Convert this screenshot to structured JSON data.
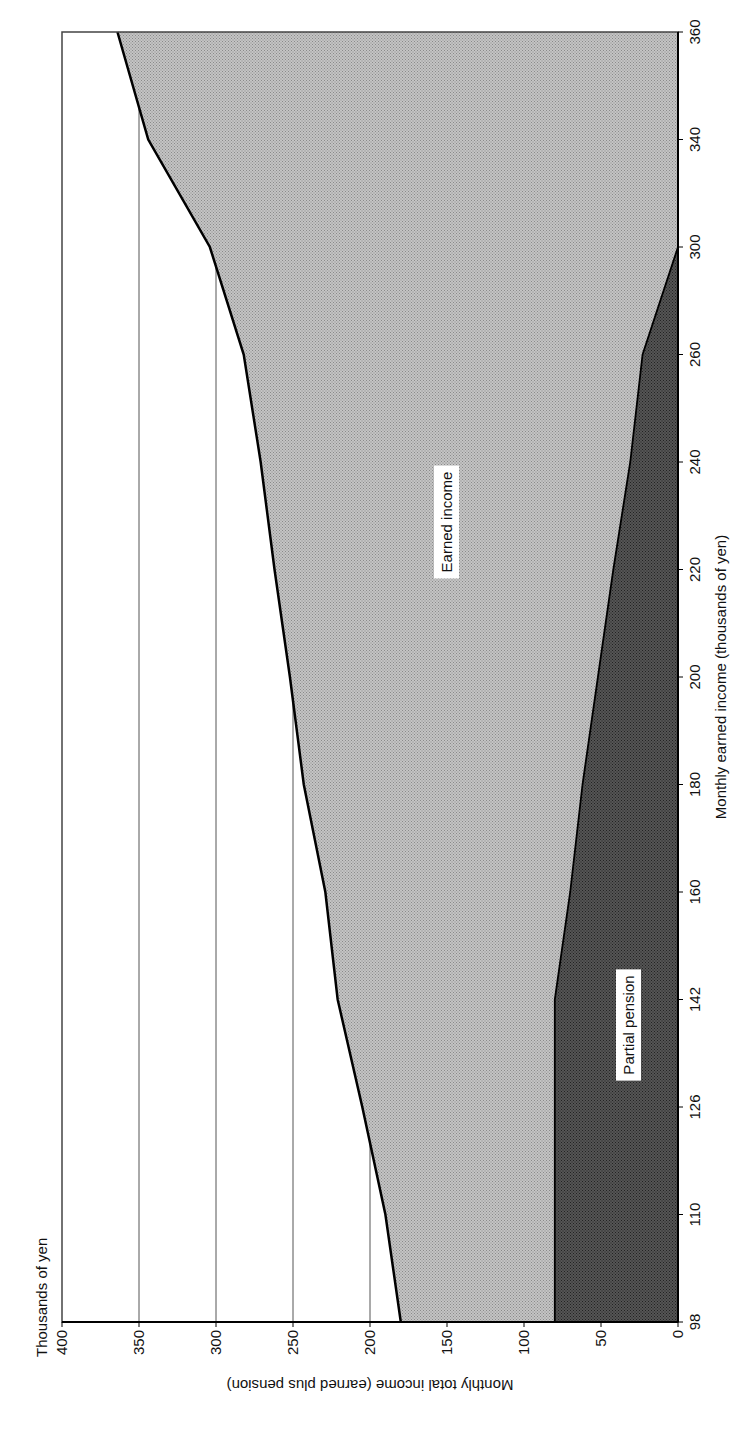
{
  "chart_data": {
    "type": "area",
    "stacked": true,
    "orientation": "rotated-90-ccw",
    "title": "",
    "ylabel_top": "Thousands of yen",
    "xlabel": "Monthly earned income (thousands of yen)",
    "ylabel": "Monthly total income (earned plus pension)",
    "categories": [
      98,
      110,
      126,
      142,
      160,
      180,
      200,
      220,
      240,
      260,
      300,
      340,
      360
    ],
    "series": [
      {
        "name": "Partial pension",
        "values": [
          80,
          80,
          80,
          80,
          70,
          62,
          52,
          42,
          31,
          23,
          0,
          0,
          0
        ],
        "color": "#4a4a4a"
      },
      {
        "name": "Earned income",
        "values": [
          98,
          110,
          126,
          142,
          160,
          180,
          200,
          220,
          240,
          260,
          300,
          340,
          360
        ],
        "color": "#b3b3b3"
      }
    ],
    "total_income": [
      180,
      190,
      205,
      221,
      229,
      243,
      252,
      262,
      271,
      282,
      304,
      344,
      364
    ],
    "ylim": [
      0,
      400
    ],
    "yticks": [
      0,
      50,
      100,
      150,
      200,
      250,
      300,
      350,
      400
    ],
    "grid": {
      "horizontal": true,
      "vertical": false
    },
    "legend": "none",
    "annotations": [
      "Earned income",
      "Partial pension"
    ]
  },
  "labels": {
    "units": "Thousands of yen",
    "x_title": "Monthly earned income (thousands of yen)",
    "y_title": "Monthly total income (earned plus pension)",
    "earned_region": "Earned income",
    "pension_region": "Partial pension"
  },
  "colors": {
    "earned_fill": "#b3b3b3",
    "pension_fill": "#4a4a4a",
    "boundary_line": "#000000",
    "grid_line": "#555555"
  }
}
